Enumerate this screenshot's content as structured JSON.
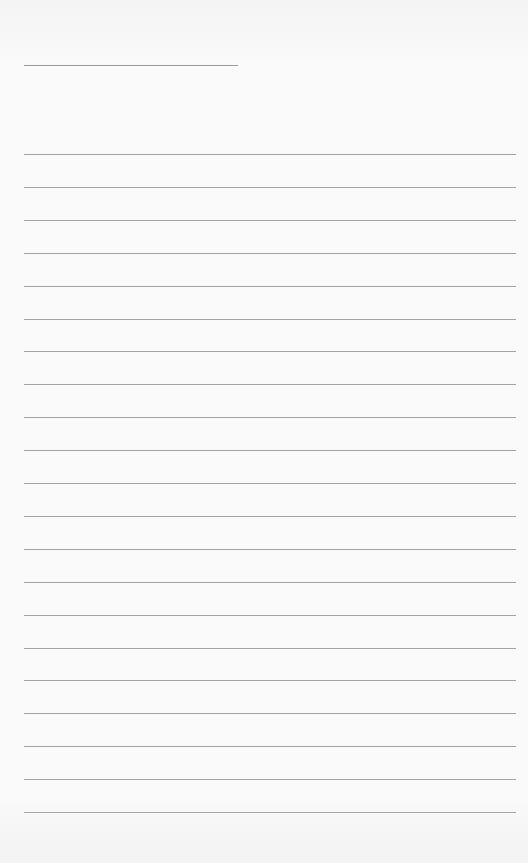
{
  "page": {
    "type": "lined-paper",
    "background_color": "#f7f7f7",
    "line_color": "#a4a4a4"
  },
  "header_line": {
    "x": 24,
    "y": 65,
    "width": 214
  },
  "ruled_lines": {
    "count": 21,
    "start_y": 154,
    "spacing": 32.9,
    "x": 24,
    "width": 492
  }
}
